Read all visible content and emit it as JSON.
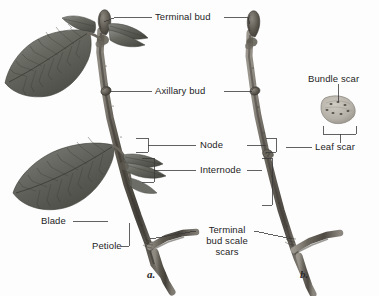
{
  "figure": {
    "background_color": "#fdfdfd",
    "line_color": "#3a3a3a",
    "text_color": "#1d1d1d"
  },
  "panels": [
    {
      "id": "a",
      "label": "a.",
      "caption": "Leafy summer twig with blades and petioles"
    },
    {
      "id": "b",
      "label": "b.",
      "caption": "Bare winter twig showing scars"
    }
  ],
  "labels": {
    "terminal_bud": "Terminal bud",
    "axillary_bud": "Axillary bud",
    "node": "Node",
    "internode": "Internode",
    "blade": "Blade",
    "petiole": "Petiole",
    "terminal_bud_scale_scars_line1": "Terminal",
    "terminal_bud_scale_scars_line2": "bud scale",
    "terminal_bud_scale_scars_line3": "scars",
    "bundle_scar": "Bundle scar",
    "leaf_scar": "Leaf scar"
  },
  "detail_inset": {
    "name": "leaf-scar-detail",
    "bundle_scar_dot_count": 7,
    "scar_fill": "#b9b5ad",
    "scar_stroke": "#7d7a72"
  },
  "colors": {
    "twig_dark": "#4b4842",
    "twig_mid": "#75716a",
    "twig_light": "#a6a29a",
    "leaf_dark": "#4e4f4b",
    "leaf_mid": "#6e706b",
    "leaf_light": "#95968f",
    "bud": "#5a564f"
  }
}
